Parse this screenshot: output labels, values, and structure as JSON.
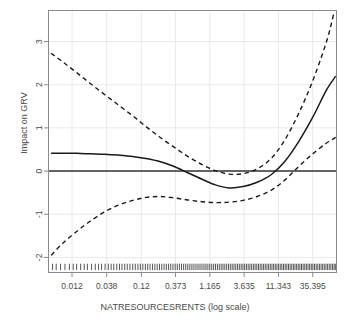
{
  "chart_data": {
    "type": "line",
    "title": "",
    "xlabel": "NATRESOURCESRENTS (log scale)",
    "ylabel": "Impact on GRV",
    "x_scale": "log",
    "grid": true,
    "legend": null,
    "xticks": [
      "0.012",
      "0.038",
      "0.12",
      "0.373",
      "1.165",
      "3.635",
      "11.343",
      "35.395"
    ],
    "xtick_values": [
      0.012,
      0.038,
      0.12,
      0.373,
      1.165,
      3.635,
      11.343,
      35.395
    ],
    "yticks": [
      "3",
      "2",
      "1",
      "0",
      "-1",
      "-2"
    ],
    "ytick_values": [
      3,
      2,
      1,
      0,
      -1,
      -2
    ],
    "xlim": [
      0.0055,
      78.0
    ],
    "ylim": [
      -2.35,
      3.72
    ],
    "reference_line_y": 0,
    "series": [
      {
        "name": "fit",
        "style": "solid",
        "x": [
          0.006,
          0.009,
          0.014,
          0.022,
          0.035,
          0.056,
          0.09,
          0.14,
          0.22,
          0.35,
          0.56,
          0.9,
          1.4,
          2.2,
          3.5,
          5.6,
          9.0,
          14.0,
          22.0,
          35.0,
          56.0,
          76.0
        ],
        "y": [
          0.41,
          0.41,
          0.41,
          0.4,
          0.39,
          0.37,
          0.34,
          0.29,
          0.22,
          0.11,
          -0.04,
          -0.19,
          -0.32,
          -0.39,
          -0.36,
          -0.26,
          -0.08,
          0.22,
          0.67,
          1.23,
          1.88,
          2.2
        ]
      },
      {
        "name": "upper-confidence",
        "style": "dashed",
        "x": [
          0.006,
          0.009,
          0.014,
          0.022,
          0.035,
          0.056,
          0.09,
          0.14,
          0.22,
          0.35,
          0.56,
          0.9,
          1.4,
          2.2,
          3.5,
          5.6,
          9.0,
          14.0,
          22.0,
          35.0,
          56.0,
          72.0
        ],
        "y": [
          2.73,
          2.52,
          2.28,
          2.03,
          1.78,
          1.53,
          1.28,
          1.03,
          0.79,
          0.56,
          0.34,
          0.15,
          0.01,
          -0.07,
          -0.06,
          0.05,
          0.3,
          0.72,
          1.32,
          2.07,
          3.0,
          3.68
        ]
      },
      {
        "name": "lower-confidence",
        "style": "dashed",
        "x": [
          0.006,
          0.009,
          0.014,
          0.022,
          0.035,
          0.056,
          0.09,
          0.14,
          0.22,
          0.35,
          0.56,
          0.9,
          1.4,
          2.2,
          3.5,
          5.6,
          9.0,
          14.0,
          22.0,
          35.0,
          56.0,
          76.0
        ],
        "y": [
          -1.95,
          -1.66,
          -1.4,
          -1.16,
          -0.95,
          -0.79,
          -0.68,
          -0.61,
          -0.59,
          -0.62,
          -0.67,
          -0.71,
          -0.73,
          -0.72,
          -0.68,
          -0.59,
          -0.44,
          -0.21,
          0.1,
          0.39,
          0.65,
          0.78
        ]
      }
    ],
    "rug": {
      "label": "data-density-rug",
      "y": -2.22,
      "x": [
        0.0063,
        0.0071,
        0.0082,
        0.0095,
        0.011,
        0.0125,
        0.014,
        0.016,
        0.018,
        0.02,
        0.023,
        0.026,
        0.029,
        0.032,
        0.036,
        0.04,
        0.044,
        0.048,
        0.053,
        0.058,
        0.063,
        0.069,
        0.075,
        0.082,
        0.09,
        0.098,
        0.107,
        0.116,
        0.126,
        0.137,
        0.148,
        0.16,
        0.174,
        0.188,
        0.203,
        0.219,
        0.236,
        0.255,
        0.275,
        0.296,
        0.318,
        0.342,
        0.368,
        0.395,
        0.424,
        0.455,
        0.488,
        0.523,
        0.56,
        0.6,
        0.642,
        0.687,
        0.735,
        0.786,
        0.84,
        0.897,
        0.958,
        1.022,
        1.09,
        1.162,
        1.239,
        1.32,
        1.406,
        1.497,
        1.593,
        1.695,
        1.803,
        1.917,
        2.038,
        2.166,
        2.301,
        2.444,
        2.595,
        2.755,
        2.924,
        3.102,
        3.291,
        3.49,
        3.7,
        3.922,
        4.156,
        4.403,
        4.664,
        4.939,
        5.229,
        5.535,
        5.858,
        6.198,
        6.557,
        6.935,
        7.334,
        7.754,
        8.197,
        8.664,
        9.156,
        9.675,
        10.22,
        10.8,
        11.41,
        12.05,
        12.73,
        13.45,
        14.2,
        15.0,
        15.84,
        16.72,
        17.65,
        18.64,
        19.67,
        20.77,
        21.92,
        23.14,
        24.42,
        25.78,
        27.21,
        28.72,
        30.32,
        32.0,
        33.78,
        35.66,
        37.64,
        39.73,
        41.94,
        44.27,
        46.73,
        49.33,
        52.07,
        54.96,
        58.01,
        61.23,
        64.63,
        68.21,
        71.99,
        75.0
      ]
    },
    "colors": {
      "line": "#1a1a1a",
      "confidence": "#1a1a1a",
      "reference": "#333333",
      "grid": "#e8e8ee",
      "axis": "#8a8a8a",
      "text": "#4a4a4a",
      "background": "#ffffff"
    }
  }
}
